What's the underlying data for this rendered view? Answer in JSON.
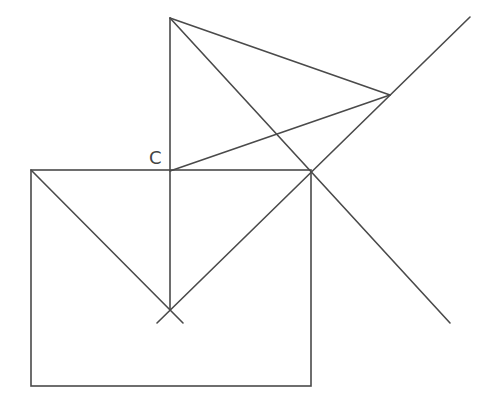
{
  "diagram": {
    "labels": [
      {
        "id": "point-c",
        "text": "C",
        "x": 149,
        "y": 164
      }
    ],
    "colors": {
      "stroke": "#4a4a4a",
      "label": "#444444",
      "background": "#ffffff"
    },
    "points": {
      "top": [
        170,
        18
      ],
      "right_vertex": [
        390,
        95
      ],
      "C": [
        170,
        171
      ],
      "junction": [
        312,
        172
      ],
      "bottom_cross": [
        170,
        310
      ],
      "rect_top_left": [
        31,
        170
      ],
      "rect_bottom_right": [
        311,
        386
      ]
    }
  }
}
